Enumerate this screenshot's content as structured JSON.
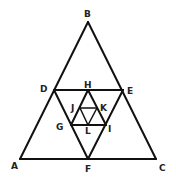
{
  "diagram": {
    "type": "nested-triangles",
    "line_color": "#111111",
    "points": {
      "A": {
        "x": 20,
        "y": 159
      },
      "B": {
        "x": 88,
        "y": 22
      },
      "C": {
        "x": 156,
        "y": 159
      },
      "D": {
        "x": 54,
        "y": 90
      },
      "E": {
        "x": 123,
        "y": 90
      },
      "F": {
        "x": 88,
        "y": 159
      },
      "H": {
        "x": 88,
        "y": 90
      },
      "G": {
        "x": 71,
        "y": 125
      },
      "I": {
        "x": 106,
        "y": 125
      },
      "J": {
        "x": 80,
        "y": 108
      },
      "K": {
        "x": 97,
        "y": 108
      },
      "L": {
        "x": 88,
        "y": 125
      }
    },
    "labels": {
      "A": {
        "text": "A",
        "x": 11,
        "y": 169
      },
      "B": {
        "text": "B",
        "x": 84,
        "y": 17
      },
      "C": {
        "text": "C",
        "x": 159,
        "y": 171
      },
      "D": {
        "text": "D",
        "x": 40,
        "y": 92
      },
      "E": {
        "text": "E",
        "x": 127,
        "y": 94
      },
      "F": {
        "text": "F",
        "x": 85,
        "y": 172
      },
      "H": {
        "text": "H",
        "x": 84,
        "y": 88
      },
      "G": {
        "text": "G",
        "x": 56,
        "y": 130
      },
      "I": {
        "text": "I",
        "x": 108,
        "y": 132
      },
      "J": {
        "text": "J",
        "x": 71,
        "y": 111
      },
      "K": {
        "text": "K",
        "x": 100,
        "y": 111
      },
      "L": {
        "text": "L",
        "x": 85,
        "y": 134
      }
    },
    "segments": [
      [
        "A",
        "B"
      ],
      [
        "B",
        "C"
      ],
      [
        "A",
        "C"
      ],
      [
        "D",
        "E"
      ],
      [
        "D",
        "F"
      ],
      [
        "E",
        "F"
      ],
      [
        "H",
        "G"
      ],
      [
        "H",
        "I"
      ],
      [
        "G",
        "I"
      ],
      [
        "J",
        "K"
      ],
      [
        "J",
        "L"
      ],
      [
        "K",
        "L"
      ]
    ]
  }
}
